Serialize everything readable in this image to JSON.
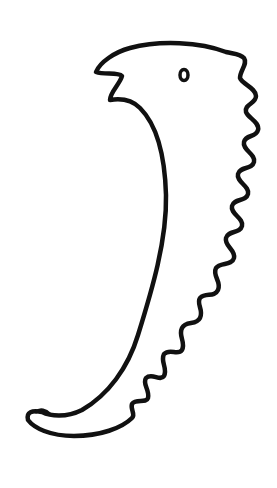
{
  "drawing": {
    "subject": "hand-drawn creature sketch",
    "stroke_color": "#111111",
    "background_color": "#ffffff",
    "parts": [
      "head-with-beak",
      "eye",
      "curved-body",
      "wavy-spine",
      "tail"
    ]
  }
}
